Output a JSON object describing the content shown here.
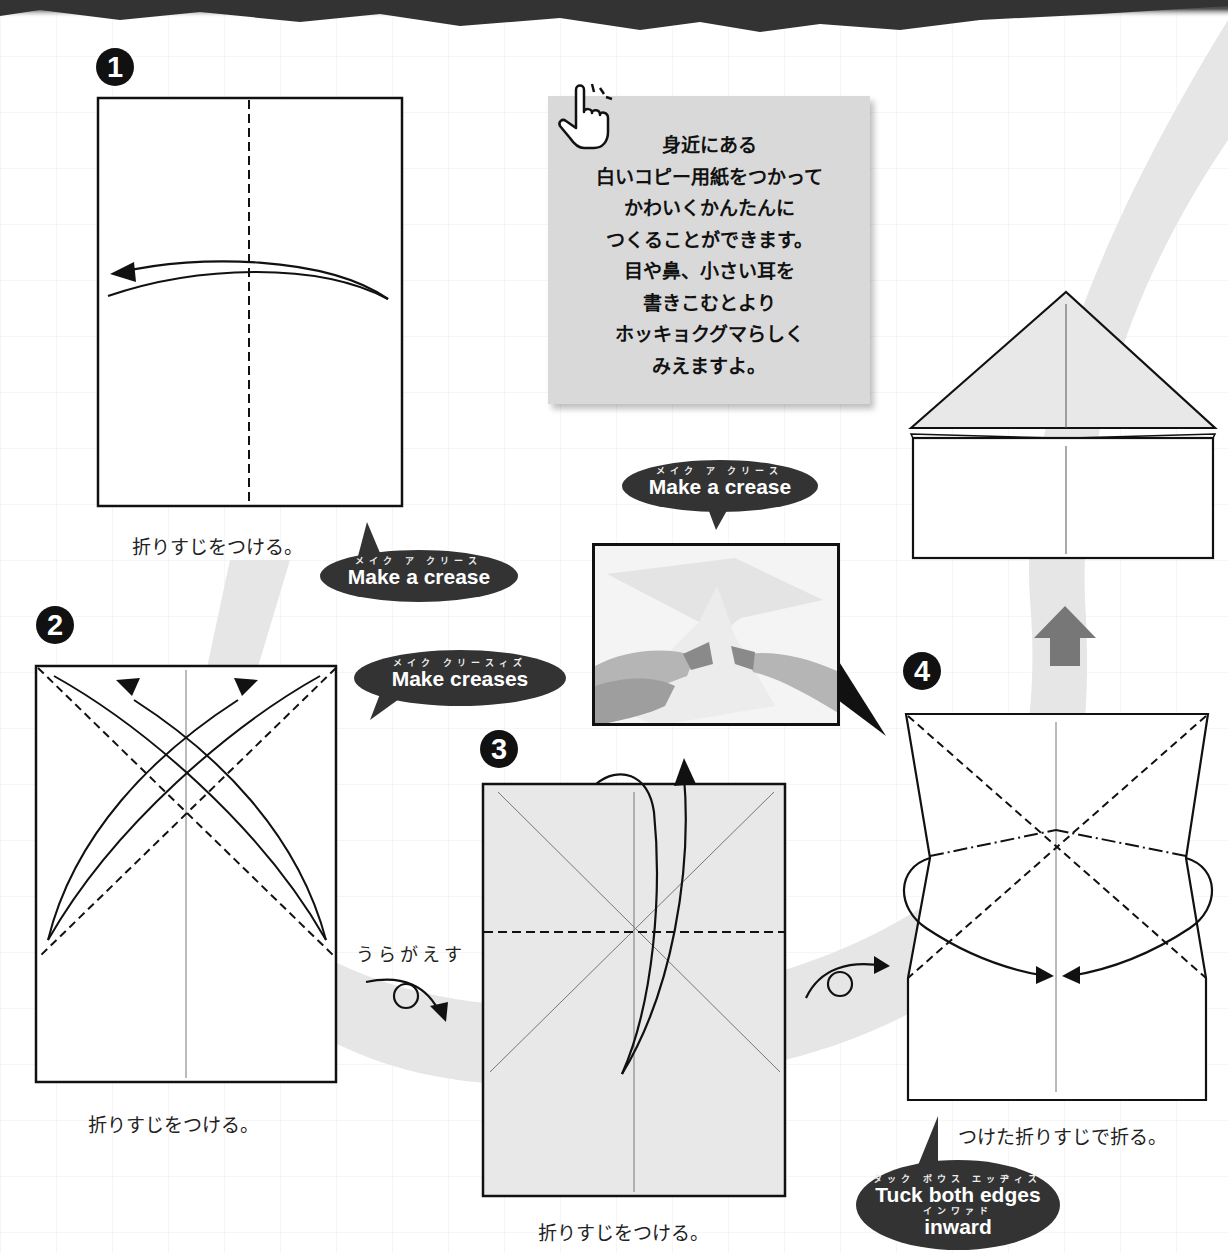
{
  "page": {
    "type": "origami instructions"
  },
  "intro_note": {
    "icon": "pointing-hand-icon",
    "lines": [
      "身近にある",
      "白いコピー用紙をつかって",
      "かわいくかんたんに",
      "つくることができます。",
      "目や鼻、小さい耳を",
      "書きこむとより",
      "ホッキョクグマらしく",
      "みえますよ。"
    ]
  },
  "steps": [
    {
      "number": "1",
      "caption": "折りすじをつける。",
      "bubble": {
        "ruby": "メイク ア クリース",
        "text": "Make a crease"
      }
    },
    {
      "number": "2",
      "caption": "折りすじをつける。",
      "bubble": {
        "ruby": "メイク クリースィズ",
        "text": "Make creases"
      },
      "turn_over_label": "うらがえす"
    },
    {
      "number": "3",
      "caption": "折りすじをつける。",
      "bubble": {
        "ruby": "メイク ア クリース",
        "text": "Make a crease"
      }
    },
    {
      "number": "4",
      "caption": "つけた折りすじで折る。",
      "bubble": {
        "ruby": "タック ボウス エッヂィズ",
        "text": "Tuck both edges",
        "ruby2": "インワァド",
        "text2": "inward"
      }
    }
  ],
  "colors": {
    "band": "#e6e6e6",
    "paper_shaded": "#e8e8e8",
    "bubble": "#333333",
    "note_bg": "#d9d9d9",
    "arrow_up": "#777777"
  }
}
